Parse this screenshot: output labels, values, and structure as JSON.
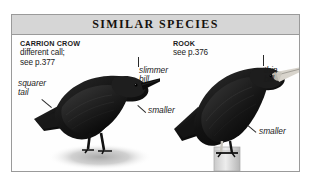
{
  "panel": {
    "title": "SIMILAR SPECIES"
  },
  "species": [
    {
      "id": "carrion-crow",
      "name": "CARRION CROW",
      "detail_line1": "different call;",
      "detail_line2": "see p.377",
      "annotations": [
        {
          "id": "squarer-tail",
          "line1": "squarer",
          "line2": "tail"
        },
        {
          "id": "slimmer-bill",
          "line1": "slimmer",
          "line2": "bill"
        },
        {
          "id": "smaller-left",
          "line1": "smaller",
          "line2": ""
        }
      ]
    },
    {
      "id": "rook",
      "name": "ROOK",
      "detail_line1": "see p.376",
      "detail_line2": "",
      "annotations": [
        {
          "id": "thin-bill",
          "line1": "thin",
          "line2": "bill"
        },
        {
          "id": "smaller-right",
          "line1": "smaller",
          "line2": ""
        }
      ]
    }
  ],
  "colors": {
    "banner_bg": "#d6d6d6",
    "frame_border": "#9a9a9a",
    "text": "#1b1b1b",
    "plate_bg": "#fefefe",
    "bird_dark": "#141414",
    "ground_shadow": "#b9b9b9",
    "rook_bill": "#d8d4cc",
    "perch": "#d2d2d2"
  }
}
